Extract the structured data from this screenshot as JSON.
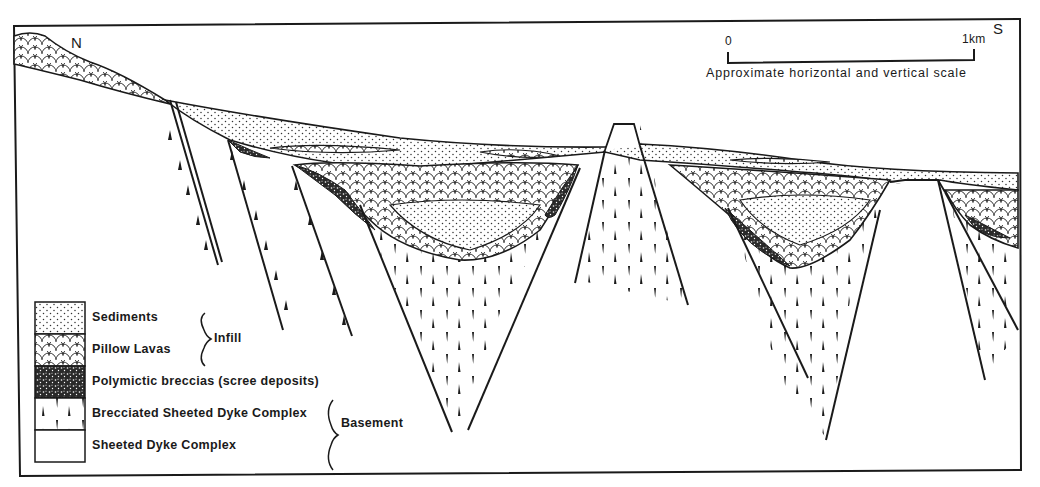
{
  "figure": {
    "type": "geological cross-section",
    "orientation": {
      "left": "N",
      "right": "S"
    },
    "scale_bar": {
      "start_label": "0",
      "end_label": "1km",
      "caption": "Approximate horizontal and vertical scale"
    },
    "legend": {
      "items": [
        {
          "label": "Sediments",
          "pattern": "dotted"
        },
        {
          "label": "Pillow Lavas",
          "pattern": "scalloped"
        },
        {
          "label": "Polymictic breccias (scree deposits)",
          "pattern": "dense-speckle"
        },
        {
          "label": "Brecciated Sheeted Dyke Complex",
          "pattern": "triangles"
        },
        {
          "label": "Sheeted Dyke Complex",
          "pattern": "blank"
        }
      ],
      "groups": [
        {
          "label": "Infill",
          "covers": [
            "Sediments",
            "Pillow Lavas"
          ]
        },
        {
          "label": "Basement",
          "covers": [
            "Brecciated Sheeted Dyke Complex",
            "Sheeted Dyke Complex"
          ]
        }
      ]
    },
    "colors": {
      "ink": "#1a1a1a",
      "paper": "#ffffff"
    }
  }
}
